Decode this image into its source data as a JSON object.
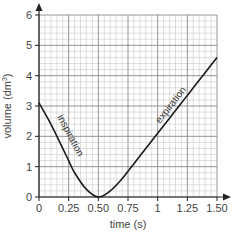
{
  "chart_data": {
    "type": "line",
    "title": "",
    "xlabel": "time (s)",
    "ylabel": "volume (dm³)",
    "xlim": [
      0,
      1.5
    ],
    "ylim": [
      0,
      6
    ],
    "grid": true,
    "x_ticks": [
      "0",
      "0.25",
      "0.50",
      "0.75",
      "1",
      "1.25",
      "1.50"
    ],
    "y_ticks": [
      "0",
      "1",
      "2",
      "3",
      "4",
      "5",
      "6"
    ],
    "series": [
      {
        "name": "lung volume",
        "x": [
          0,
          0.1,
          0.2,
          0.25,
          0.3,
          0.4,
          0.5,
          0.6,
          0.7,
          0.75,
          0.8,
          0.9,
          1.0,
          1.1,
          1.2,
          1.25,
          1.3,
          1.4,
          1.5
        ],
        "values": [
          3.1,
          2.4,
          1.6,
          1.2,
          0.8,
          0.25,
          0.0,
          0.2,
          0.6,
          0.85,
          1.1,
          1.6,
          2.1,
          2.6,
          3.1,
          3.35,
          3.6,
          4.1,
          4.6
        ]
      }
    ],
    "annotations": [
      {
        "text": "inspiration",
        "x": 0.15,
        "y": 2.0
      },
      {
        "text": "expiration",
        "x": 1.15,
        "y": 3.6
      }
    ],
    "legend": null
  },
  "labels": {
    "xlabel": "time (s)",
    "ylabel_main": "volume (dm",
    "ylabel_sup": "3",
    "ylabel_close": ")",
    "inspiration": "inspiration",
    "expiration": "expiration",
    "x_ticks": [
      "0",
      "0.25",
      "0.50",
      "0.75",
      "1",
      "1.25",
      "1.50"
    ],
    "y_ticks": [
      "0",
      "1",
      "2",
      "3",
      "4",
      "5",
      "6"
    ]
  }
}
